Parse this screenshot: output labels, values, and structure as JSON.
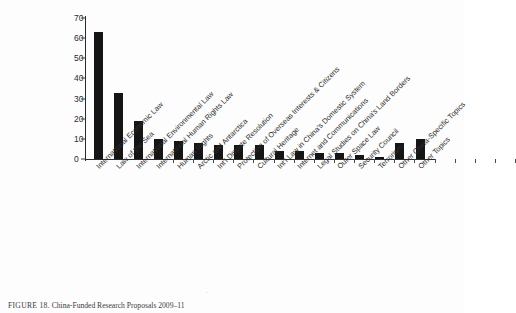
{
  "figure": {
    "caption_label": "FIGURE 18.",
    "caption_text": "China-Funded Research Proposals 2009–11",
    "artifact_glyph": "·"
  },
  "chart_data": {
    "type": "bar",
    "title": "",
    "subtitle": "",
    "xlabel": "",
    "ylabel": "",
    "ylim": [
      0,
      70
    ],
    "yticks": [
      0,
      10,
      20,
      30,
      40,
      50,
      60,
      70
    ],
    "ytick_labels": [
      "0",
      "10",
      "20",
      "30",
      "40",
      "50",
      "60",
      "70"
    ],
    "grid": false,
    "legend": null,
    "bar_color": "#151515",
    "categories": [
      "International Economic Law",
      "Law of the Sea",
      "International Environmental Law",
      "International Human Rights Law",
      "Human Rights",
      "Arctic and Antarctica",
      "Int'l Dispute Resolution",
      "Protection of Overseas Interests & Citizens",
      "Cultural Heritage",
      "Int'l Law in China's Domestic System",
      "Internet and Communications",
      "Legal Studies on China's Land Borders",
      "Outer Space Law",
      "Security Council",
      "Terrorism",
      "Other China-Specific Topics",
      "Other Topics"
    ],
    "values": [
      63,
      33,
      19,
      10,
      9,
      8,
      7,
      7,
      7,
      4,
      4,
      3,
      3,
      2,
      1,
      8,
      10
    ]
  }
}
